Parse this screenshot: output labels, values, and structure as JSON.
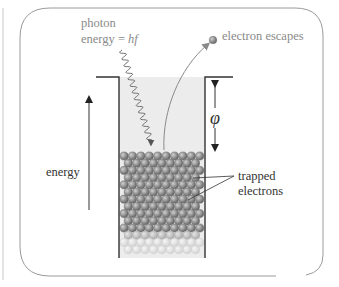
{
  "diagram": {
    "labels": {
      "photon_line1": "photon",
      "photon_line2_prefix": "energy = ",
      "photon_line2_var": "hf",
      "electron_escapes": "electron escapes",
      "work_function": "φ",
      "energy_axis": "energy",
      "trapped_line1": "trapped",
      "trapped_line2": "electrons"
    },
    "icons": {
      "photon": "wavy-arrow",
      "escape": "curved-arrow",
      "electron": "grey-sphere",
      "energy_axis": "up-arrow",
      "work_function": "double-headed-arrow"
    },
    "colors": {
      "frame": "#9a9a9a",
      "well_wall": "#333333",
      "well_fill": "#ececec",
      "electron_dark": "#8c8c8c",
      "electron_mid": "#b4b4b4",
      "electron_light": "#d8d8d8",
      "photon": "#6e6e6e",
      "escape_curve": "#8a8a8a",
      "text_dark": "#333333",
      "text_grey": "#8a8a8a"
    }
  }
}
